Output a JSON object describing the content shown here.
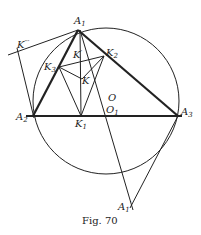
{
  "figure": {
    "caption": "Fig. 70",
    "labels": {
      "A1": {
        "base": "A",
        "sub": "1"
      },
      "A2": {
        "base": "A",
        "sub": "2"
      },
      "A3": {
        "base": "A",
        "sub": "3"
      },
      "A1p": {
        "base": "A",
        "sub": "1",
        "prime": "′"
      },
      "K": {
        "base": "K"
      },
      "K1": {
        "base": "K",
        "sub": "1"
      },
      "K2": {
        "base": "K",
        "sub": "2"
      },
      "K3": {
        "base": "K",
        "sub": "3"
      },
      "Kp": {
        "base": "K",
        "prime": "′"
      },
      "Kppp": {
        "base": "K",
        "prime": "′′′"
      },
      "O": {
        "base": "O"
      },
      "O1": {
        "base": "O",
        "sub": "1"
      }
    },
    "colors": {
      "ink": "#222222",
      "background": "#ffffff"
    }
  }
}
